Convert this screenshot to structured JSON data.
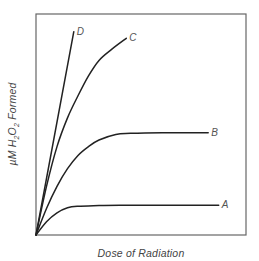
{
  "chart_data": {
    "type": "line",
    "title": "",
    "xlabel": "Dose of Radiation",
    "ylabel": "µM H2O2 Formed",
    "ylabel_display": {
      "prefix": "µM H",
      "sub1": "2",
      "mid": "O",
      "sub2": "2",
      "suffix": " Formed"
    },
    "xlim": [
      0,
      100
    ],
    "ylim": [
      0,
      100
    ],
    "x_ticks": [],
    "y_ticks": [],
    "grid": false,
    "legend": "inline labels at curve ends",
    "units_note": "qualitative; no tick values shown",
    "series": [
      {
        "name": "A",
        "x": [
          0,
          5,
          10,
          15,
          20,
          30,
          40,
          60,
          87
        ],
        "y": [
          0,
          6,
          10,
          12.3,
          13,
          13.3,
          13.5,
          13.5,
          13.5
        ]
      },
      {
        "name": "B",
        "x": [
          0,
          5,
          10,
          15,
          20,
          25,
          30,
          38,
          45,
          60,
          82
        ],
        "y": [
          0,
          12,
          22,
          30,
          36,
          40,
          43,
          45.5,
          46,
          46.3,
          46.3
        ]
      },
      {
        "name": "C",
        "x": [
          0,
          5,
          10,
          15,
          20,
          25,
          30,
          36,
          43
        ],
        "y": [
          0,
          22,
          40,
          53,
          63,
          72,
          79,
          84,
          89
        ]
      },
      {
        "name": "D",
        "x": [
          0,
          18
        ],
        "y": [
          0,
          92
        ]
      }
    ]
  },
  "labels": {
    "A": "A",
    "B": "B",
    "C": "C",
    "D": "D"
  },
  "colors": {
    "frame": "#555555",
    "curve": "#222222",
    "text": "#444444"
  }
}
